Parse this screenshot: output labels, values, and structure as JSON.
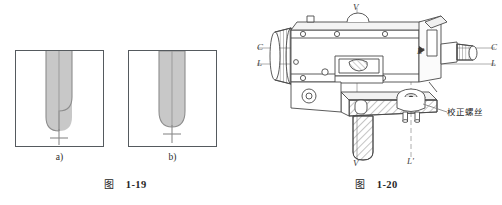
{
  "page": {
    "background": "#ffffff",
    "ink": "#2b2b2b"
  },
  "figure_1_19": {
    "caption_cjk": "图",
    "caption_number": "1-19",
    "panels": [
      {
        "id": "a",
        "sublabel": "a)",
        "description": "crosshair offset from center of U-shaped field, left and right edges of groove at different depths",
        "aligned": false
      },
      {
        "id": "b",
        "sublabel": "b)",
        "description": "crosshair centered on symmetric U-shaped field",
        "aligned": true
      }
    ],
    "colors": {
      "frame_border": "#555a5e",
      "groove_fill": "#c8c8c8",
      "groove_stroke": "#8d8d8d",
      "crosshair": "#8a8a8a"
    }
  },
  "figure_1_20": {
    "caption_cjk": "图",
    "caption_number": "1-20",
    "instrument": "surveying level (water level instrument)",
    "axis_labels": {
      "collimation_left": "C",
      "collimation_right": "C",
      "level_left": "L",
      "level_right": "L",
      "vertical_top": "V",
      "vertical_bottom": "V",
      "level_prime_upper": "L'",
      "level_prime_lower": "L'"
    },
    "callouts": [
      {
        "text": "校正螺丝",
        "target": "adjusting screws at base of level vial mount"
      }
    ],
    "colors": {
      "outline": "#4a4a4a",
      "hatch": "#6b6b6b",
      "axis_line": "#9a9a9a",
      "fill": "#ffffff",
      "shade": "#e9e9e9"
    }
  }
}
